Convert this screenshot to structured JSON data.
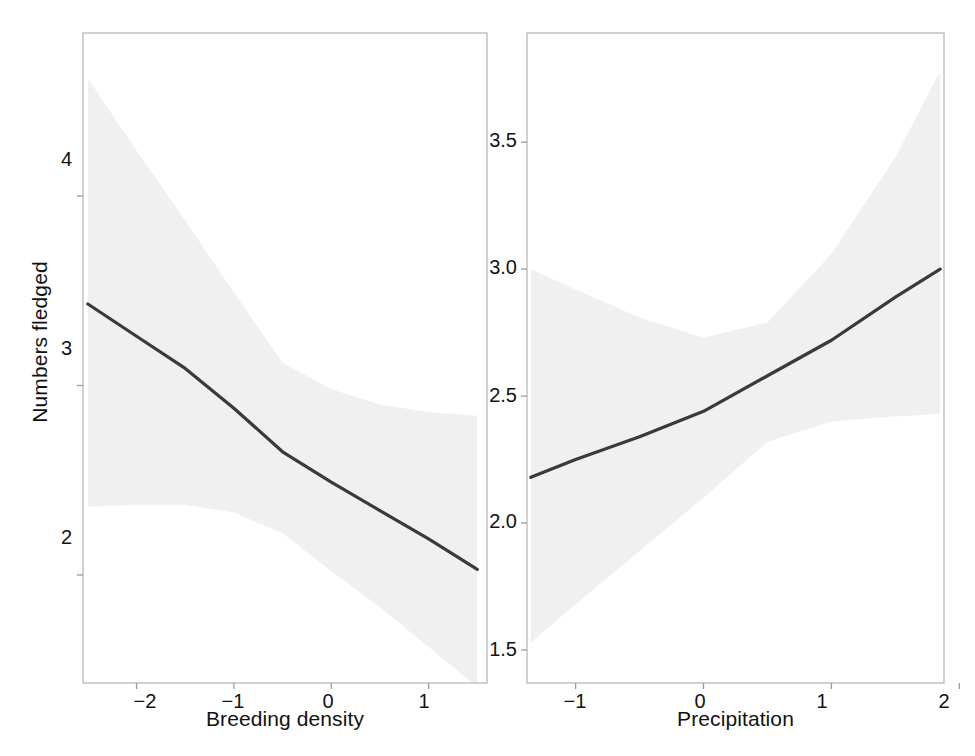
{
  "figure": {
    "background_color": "#ffffff",
    "line_color": "#3a3a3a",
    "band_color": "#f0f0f0",
    "frame_color": "#b9b9b9",
    "text_color": "#121212"
  },
  "chart_data": [
    {
      "type": "line",
      "panel": "left",
      "title": "",
      "xlabel": "Breeding density",
      "ylabel": "Numbers fledged",
      "xlim": [
        -2.55,
        1.6
      ],
      "ylim": [
        1.43,
        4.86
      ],
      "xticks": [
        -2,
        -1,
        0,
        1
      ],
      "xticklabels": [
        "−2",
        "−1",
        "0",
        "1"
      ],
      "yticks": [
        4,
        3,
        2
      ],
      "yticklabels": [
        "4",
        "3",
        "2"
      ],
      "grid": false,
      "legend": "none",
      "series": [
        {
          "name": "fit",
          "x": [
            -2.5,
            -2.0,
            -1.5,
            -1.0,
            -0.5,
            0.0,
            0.5,
            1.0,
            1.5
          ],
          "values": [
            3.43,
            3.26,
            3.09,
            2.88,
            2.65,
            2.49,
            2.34,
            2.19,
            2.03
          ]
        },
        {
          "name": "ci_upper",
          "x": [
            -2.5,
            -2.0,
            -1.5,
            -1.0,
            -0.5,
            0.0,
            0.5,
            1.0,
            1.5
          ],
          "values": [
            4.62,
            4.24,
            3.87,
            3.49,
            3.12,
            2.98,
            2.9,
            2.86,
            2.84
          ]
        },
        {
          "name": "ci_lower",
          "x": [
            -2.5,
            -2.0,
            -1.5,
            -1.0,
            -0.5,
            0.0,
            0.5,
            1.0,
            1.5
          ],
          "values": [
            2.36,
            2.37,
            2.37,
            2.33,
            2.22,
            2.02,
            1.83,
            1.62,
            1.41
          ]
        }
      ]
    },
    {
      "type": "line",
      "panel": "right",
      "title": "",
      "xlabel": "Precipitation",
      "ylabel": "",
      "xlim": [
        -1.38,
        1.88
      ],
      "ylim": [
        1.37,
        3.93
      ],
      "xticks": [
        -1,
        0,
        1,
        2
      ],
      "xticklabels": [
        "−1",
        "0",
        "1",
        "2"
      ],
      "yticks": [
        3.5,
        3.0,
        2.5,
        2.0,
        1.5
      ],
      "yticklabels": [
        "3.5",
        "3.0",
        "2.5",
        "2.0",
        "1.5"
      ],
      "grid": false,
      "legend": "none",
      "series": [
        {
          "name": "fit",
          "x": [
            -1.35,
            -1.0,
            -0.5,
            0.0,
            0.5,
            1.0,
            1.5,
            1.85
          ],
          "values": [
            2.18,
            2.25,
            2.34,
            2.44,
            2.58,
            2.72,
            2.89,
            3.0
          ]
        },
        {
          "name": "ci_upper",
          "x": [
            -1.35,
            -1.0,
            -0.5,
            0.0,
            0.5,
            1.0,
            1.5,
            1.85
          ],
          "values": [
            3.0,
            2.92,
            2.81,
            2.73,
            2.79,
            3.06,
            3.44,
            3.78
          ]
        },
        {
          "name": "ci_lower",
          "x": [
            -1.35,
            -1.0,
            -0.5,
            0.0,
            0.5,
            1.0,
            1.5,
            1.85
          ],
          "values": [
            1.53,
            1.68,
            1.89,
            2.1,
            2.32,
            2.4,
            2.42,
            2.43
          ]
        }
      ]
    }
  ],
  "left_panel": {
    "xlabel": "Breeding density",
    "ylabel": "Numbers fledged",
    "xticklabels": [
      "−2",
      "−1",
      "0",
      "1"
    ],
    "yticklabels": [
      "4",
      "3",
      "2"
    ]
  },
  "right_panel": {
    "xlabel": "Precipitation",
    "ylabel": "",
    "xticklabels": [
      "−1",
      "0",
      "1",
      "2"
    ],
    "yticklabels": [
      "3.5",
      "3.0",
      "2.5",
      "2.0",
      "1.5"
    ]
  }
}
